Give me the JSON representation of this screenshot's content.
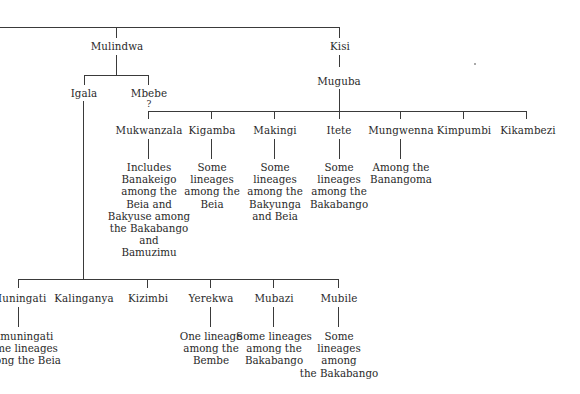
{
  "root": {
    "branches": [
      {
        "name": "Mulindwa",
        "children": [
          {
            "name": "Igala",
            "children": [
              {
                "name": "Muningati",
                "desc": "Bamuningati\nSome lineages\namong the Beia"
              },
              {
                "name": "Kalinganya",
                "desc": ""
              },
              {
                "name": "Kizimbi",
                "desc": ""
              },
              {
                "name": "Yerekwa",
                "desc": "One lineage\namong the\nBembe"
              },
              {
                "name": "Mubazi",
                "desc": "Some lineages\namong the\nBakabango"
              },
              {
                "name": "Mubile",
                "desc": "Some\nlineages\namong\nthe Bakabango"
              }
            ]
          },
          {
            "name": "Mbebe",
            "qualifier": "?",
            "children": [
              {
                "name": "Mukwanzala",
                "desc": "Includes\nBanakeigo\namong the\nBeia and\nBakyuse among\nthe Bakabango\nand\nBamuzimu"
              },
              {
                "name": "Kigamba",
                "desc": "Some\nlineages\namong the\nBeia"
              },
              {
                "name": "Makingi",
                "desc": "Some\nlineages\namong the\nBakyunga\nand Beia"
              }
            ]
          }
        ]
      },
      {
        "name": "Kisi",
        "children": [
          {
            "name": "Muguba",
            "children": [
              {
                "name": "Itete",
                "desc": "Some\nlineages\namong the\nBakabango"
              },
              {
                "name": "Mungwenna",
                "desc": "Among the\nBanangoma"
              },
              {
                "name": "Kimpumbi",
                "desc": ""
              },
              {
                "name": "Kikambezi",
                "desc": ""
              }
            ]
          }
        ]
      }
    ]
  },
  "colors": {
    "line": "#3a3a3a",
    "text": "#2a2a2a",
    "background": "#ffffff"
  }
}
